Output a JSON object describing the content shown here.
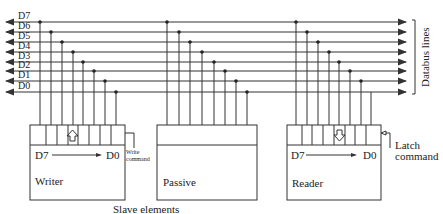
{
  "lines": [
    "D7",
    "D6",
    "D5",
    "D4",
    "D3",
    "D2",
    "D1",
    "D0"
  ],
  "databus_label": "Databus lines",
  "caption": "Slave elements",
  "elements": [
    {
      "name": "Writer",
      "direction": "up",
      "range_from": "D7",
      "range_to": "D0",
      "command": "Write command"
    },
    {
      "name": "Passive"
    },
    {
      "name": "Reader",
      "direction": "down",
      "range_from": "D7",
      "range_to": "D0",
      "command": "Latch command"
    }
  ],
  "colors": {
    "line": "#333333",
    "background": "#ffffff"
  }
}
